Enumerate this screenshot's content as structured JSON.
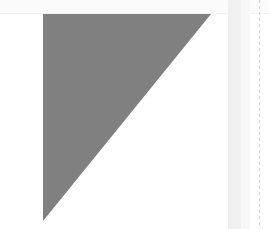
{
  "canvas": {
    "width": 269,
    "height": 229,
    "background_color": "#ffffff",
    "description": "Blank light UI canvas with a single large gray triangular shape"
  },
  "top_strip": {
    "name": "top-strip",
    "color": "#fbfbfb",
    "edge_color": "#f2f2f2",
    "height": 14
  },
  "shape": {
    "name": "gray-triangle",
    "type": "right-triangle",
    "fill_color": "#808080",
    "right_angle_corner": "top-left",
    "vertices": [
      {
        "x": 43,
        "y": 14
      },
      {
        "x": 211,
        "y": 14
      },
      {
        "x": 43,
        "y": 221
      }
    ],
    "width": 168,
    "height": 207
  },
  "right_band": {
    "name": "right-vertical-band",
    "color": "#f0f0f0",
    "soft_color": "#f7f7f7",
    "left": 228,
    "width": 13
  },
  "dotted_rule": {
    "name": "dotted-vertical-rule",
    "color": "#cfcfcf",
    "left": 259,
    "dash_length": 3,
    "gap_length": 3
  },
  "margins": {
    "left_color": "#ffffff",
    "bottom_color": "#ffffff"
  }
}
